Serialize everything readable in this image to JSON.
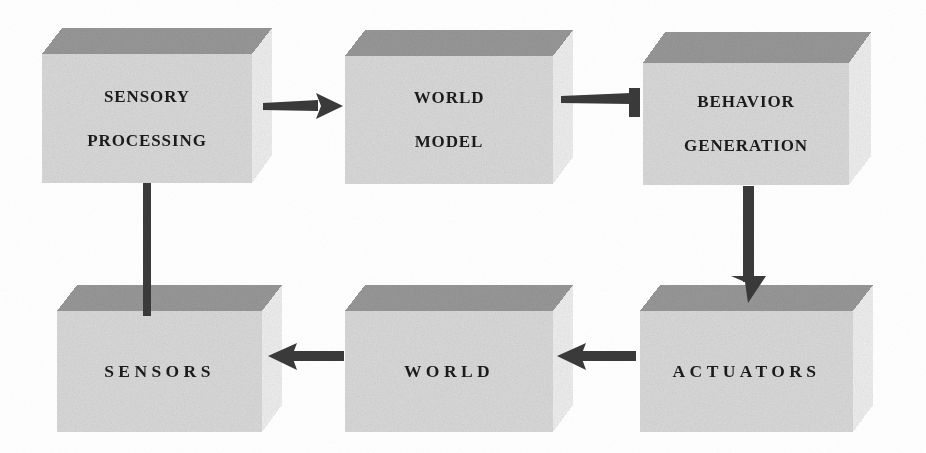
{
  "diagram": {
    "background_color": "#ffffff",
    "box_top_face_color": "#9a9a9a",
    "box_front_face_color": "#dcdcdc",
    "box_side_face_color": "#f2f2f2",
    "arrow_color": "#3a3a3a",
    "text_color": "#1b1b1b"
  },
  "boxes": [
    {
      "id": "sensory-processing",
      "lines": [
        "SENSORY",
        "PROCESSING"
      ],
      "row": "top",
      "column": "left",
      "front": {
        "x": 42,
        "y": 54,
        "w": 210,
        "h": 129
      },
      "depth_x": 20,
      "depth_y": 26
    },
    {
      "id": "world-model",
      "lines": [
        "WORLD",
        "MODEL"
      ],
      "row": "top",
      "column": "center",
      "front": {
        "x": 345,
        "y": 56,
        "w": 208,
        "h": 128
      },
      "depth_x": 20,
      "depth_y": 26
    },
    {
      "id": "behavior-generation",
      "lines": [
        "BEHAVIOR",
        "GENERATION"
      ],
      "row": "top",
      "column": "right",
      "front": {
        "x": 643,
        "y": 63,
        "w": 206,
        "h": 122
      },
      "depth_x": 22,
      "depth_y": 28
    },
    {
      "id": "sensors",
      "lines": [
        "SENSORS"
      ],
      "row": "bottom",
      "column": "left",
      "front": {
        "x": 57,
        "y": 311,
        "w": 205,
        "h": 121
      },
      "depth_x": 20,
      "depth_y": 26
    },
    {
      "id": "world",
      "lines": [
        "WORLD"
      ],
      "row": "bottom",
      "column": "center",
      "front": {
        "x": 345,
        "y": 311,
        "w": 208,
        "h": 121
      },
      "depth_x": 20,
      "depth_y": 26
    },
    {
      "id": "actuators",
      "lines": [
        "ACTUATORS"
      ],
      "row": "bottom",
      "column": "right",
      "front": {
        "x": 640,
        "y": 311,
        "w": 213,
        "h": 121
      },
      "depth_x": 20,
      "depth_y": 26
    }
  ],
  "connectors": [
    {
      "id": "sensory-processing-to-world-model",
      "from": "sensory-processing",
      "to": "world-model",
      "direction": "right",
      "head": "triangle",
      "shaft": {
        "x1": 263,
        "y1": 107,
        "x2": 336,
        "y2": 106
      }
    },
    {
      "id": "world-model-to-behavior-generation",
      "from": "world-model",
      "to": "behavior-generation",
      "direction": "right",
      "head": "bar",
      "shaft": {
        "x1": 561,
        "y1": 100,
        "x2": 637,
        "y2": 99
      }
    },
    {
      "id": "behavior-generation-to-actuators",
      "from": "behavior-generation",
      "to": "actuators",
      "direction": "down",
      "head": "triangle",
      "shaft": {
        "x1": 748,
        "y1": 186,
        "x2": 748,
        "y2": 296
      }
    },
    {
      "id": "actuators-to-world",
      "from": "actuators",
      "to": "world",
      "direction": "left",
      "head": "triangle",
      "shaft": {
        "x1": 634,
        "y1": 356,
        "x2": 566,
        "y2": 356
      }
    },
    {
      "id": "world-to-sensors",
      "from": "world",
      "to": "sensors",
      "direction": "left",
      "head": "triangle",
      "shaft": {
        "x1": 343,
        "y1": 356,
        "x2": 277,
        "y2": 356
      }
    },
    {
      "id": "sensors-to-sensory-processing",
      "from": "sensory-processing",
      "to": "sensors",
      "direction": "down",
      "head": "none",
      "shaft": {
        "x1": 147,
        "y1": 183,
        "x2": 147,
        "y2": 313
      }
    }
  ]
}
